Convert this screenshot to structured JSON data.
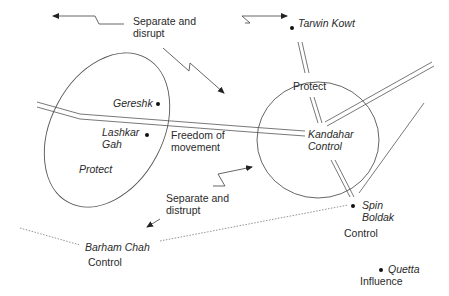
{
  "diagram": {
    "annotations": {
      "separate_top": "Separate and\ndisrupt",
      "separate_bottom": "Separate and\ndistrupt",
      "freedom": "Freedom of\nmovement"
    },
    "places": {
      "tarwin_kowt": "Tarwin Kowt",
      "gereshk": "Gereshk",
      "lashkar_gah": "Lashkar\nGah",
      "kandahar": "Kandahar\nControl",
      "spin_boldak": "Spin\nBoldak",
      "barham_chah": "Barham Chah",
      "quetta": "Quetta"
    },
    "zone_labels": {
      "helmand_protect": "Protect",
      "kandahar_protect": "Protect",
      "spin_boldak_control": "Control",
      "barham_chah_control": "Control",
      "quetta_influence": "Influence"
    },
    "colors": {
      "line": "#555555",
      "text": "#2a2a2a",
      "dot": "#111111"
    }
  }
}
